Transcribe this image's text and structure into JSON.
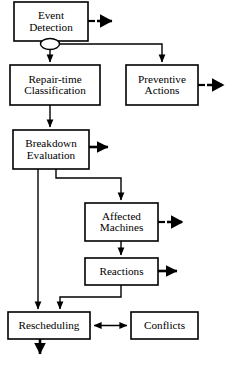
{
  "diagram": {
    "background_color": "#ffffff",
    "stroke_color": "#000000",
    "nodes": [
      {
        "id": "event-detection",
        "label": "Event\nDetection",
        "x": 14,
        "y": 2,
        "w": 74,
        "h": 39
      },
      {
        "id": "repair-time-classification",
        "label": "Repair-time\nClassification",
        "x": 10,
        "y": 65,
        "w": 90,
        "h": 40
      },
      {
        "id": "preventive-actions",
        "label": "Preventive\nActions",
        "x": 126,
        "y": 65,
        "w": 72,
        "h": 40
      },
      {
        "id": "breakdown-evaluation",
        "label": "Breakdown\nEvaluation",
        "x": 13,
        "y": 130,
        "w": 76,
        "h": 39
      },
      {
        "id": "affected-machines",
        "label": "Affected\nMachines",
        "x": 85,
        "y": 203,
        "w": 73,
        "h": 38
      },
      {
        "id": "reactions",
        "label": "Reactions",
        "x": 85,
        "y": 258,
        "w": 73,
        "h": 27
      },
      {
        "id": "rescheduling",
        "label": "Rescheduling",
        "x": 8,
        "y": 312,
        "w": 82,
        "h": 27
      },
      {
        "id": "conflicts",
        "label": "Conflicts",
        "x": 131,
        "y": 312,
        "w": 67,
        "h": 27
      }
    ],
    "connectors": [
      {
        "id": "event-detection-to-dashed-out",
        "kind": "dashed-arrow-right"
      },
      {
        "id": "event-detection-to-repair-time",
        "kind": "solid-arrow-down"
      },
      {
        "id": "event-detection-to-preventive-actions",
        "kind": "solid-arrow-down"
      },
      {
        "id": "preventive-actions-to-dashed-out",
        "kind": "dashed-arrow-right"
      },
      {
        "id": "repair-time-to-breakdown-evaluation",
        "kind": "solid-arrow-down"
      },
      {
        "id": "breakdown-evaluation-to-bold-out",
        "kind": "bold-arrow-right"
      },
      {
        "id": "breakdown-evaluation-to-affected",
        "kind": "solid-arrow-down"
      },
      {
        "id": "breakdown-evaluation-to-rescheduling",
        "kind": "solid-arrow-down"
      },
      {
        "id": "affected-machines-to-dashed-out",
        "kind": "dashed-arrow-right"
      },
      {
        "id": "affected-machines-to-reactions",
        "kind": "solid-arrow-down"
      },
      {
        "id": "reactions-to-bold-out",
        "kind": "bold-arrow-right"
      },
      {
        "id": "reactions-to-rescheduling",
        "kind": "solid-arrow-down"
      },
      {
        "id": "rescheduling-conflicts-link",
        "kind": "double-headed-arrow"
      },
      {
        "id": "rescheduling-to-bold-out",
        "kind": "bold-arrow-down"
      }
    ],
    "line-jump": {
      "id": "line-hop-ellipse",
      "cx": 50,
      "cy": 44,
      "rx": 9.5,
      "ry": 5.5
    }
  }
}
